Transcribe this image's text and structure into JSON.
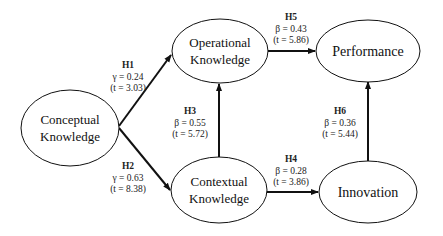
{
  "nodes": {
    "conceptual": {
      "line1": "Conceptual",
      "line2": "Knowledge"
    },
    "operational": {
      "line1": "Operational",
      "line2": "Knowledge"
    },
    "contextual": {
      "line1": "Contextual",
      "line2": "Knowledge"
    },
    "performance": {
      "label": "Performance"
    },
    "innovation": {
      "label": "Innovation"
    }
  },
  "paths": {
    "h1": {
      "id": "H1",
      "coef": "γ = 0.24",
      "t": "(t = 3.03)",
      "from": "Conceptual Knowledge",
      "to": "Operational Knowledge"
    },
    "h2": {
      "id": "H2",
      "coef": "γ = 0.63",
      "t": "(t = 8.38)",
      "from": "Conceptual Knowledge",
      "to": "Contextual Knowledge"
    },
    "h3": {
      "id": "H3",
      "coef": "β = 0.55",
      "t": "(t = 5.72)",
      "from": "Contextual Knowledge",
      "to": "Operational Knowledge"
    },
    "h4": {
      "id": "H4",
      "coef": "β = 0.28",
      "t": "(t = 3.86)",
      "from": "Contextual Knowledge",
      "to": "Innovation"
    },
    "h5": {
      "id": "H5",
      "coef": "β = 0.43",
      "t": "(t = 5.86)",
      "from": "Operational Knowledge",
      "to": "Performance"
    },
    "h6": {
      "id": "H6",
      "coef": "β = 0.36",
      "t": "(t = 5.44)",
      "from": "Innovation",
      "to": "Performance"
    }
  },
  "colors": {
    "stroke": "#111111",
    "background": "#ffffff"
  }
}
